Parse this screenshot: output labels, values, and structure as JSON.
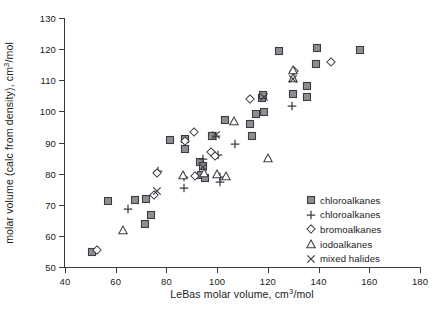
{
  "chart_data": {
    "type": "scatter",
    "title": "",
    "xlabel": "LeBas molar volume, cm3/mol",
    "ylabel": "molar volume (calc from density), cm3/mol",
    "xlabel_parts": {
      "pre": "LeBas molar volume, cm",
      "sup": "3",
      "post": "/mol"
    },
    "ylabel_parts": {
      "pre": "molar volume (calc from density), cm",
      "sup": "3",
      "post": "/mol"
    },
    "xlim": [
      40,
      180
    ],
    "ylim": [
      50,
      130
    ],
    "xticks": [
      40,
      60,
      80,
      100,
      120,
      140,
      160,
      180
    ],
    "yticks": [
      50,
      60,
      70,
      80,
      90,
      100,
      110,
      120,
      130
    ],
    "xtick_labels": [
      "40",
      "60",
      "80",
      "100",
      "120",
      "140",
      "160",
      "180"
    ],
    "ytick_labels": [
      "50",
      "60",
      "70",
      "80",
      "90",
      "100",
      "110",
      "120",
      "130"
    ],
    "grid": false,
    "legend_position": "lower right",
    "series": [
      {
        "name": "chloroalkanes",
        "marker": "square",
        "points": [
          [
            50.6,
            54.8
          ],
          [
            57.0,
            71.2
          ],
          [
            67.6,
            71.4
          ],
          [
            71.4,
            63.8
          ],
          [
            72.0,
            71.7
          ],
          [
            74.0,
            66.7
          ],
          [
            81.3,
            90.8
          ],
          [
            87.2,
            91.0
          ],
          [
            87.2,
            87.9
          ],
          [
            93.3,
            83.7
          ],
          [
            93.8,
            79.6
          ],
          [
            94.6,
            82.3
          ],
          [
            95.2,
            78.7
          ],
          [
            98.0,
            92.1
          ],
          [
            103.0,
            97.3
          ],
          [
            113.0,
            96.1
          ],
          [
            113.6,
            92.2
          ],
          [
            115.3,
            99.2
          ],
          [
            117.8,
            104.2
          ],
          [
            117.9,
            105.3
          ],
          [
            118.5,
            99.8
          ],
          [
            124.2,
            119.3
          ],
          [
            129.8,
            105.6
          ],
          [
            135.3,
            108.3
          ],
          [
            135.4,
            104.7
          ],
          [
            139.0,
            115.2
          ],
          [
            139.4,
            120.3
          ],
          [
            156.5,
            119.8
          ]
        ]
      },
      {
        "name": "chloroalkanes",
        "marker": "plus",
        "points": [
          [
            64.8,
            68.5
          ],
          [
            76.5,
            80.7
          ],
          [
            86.8,
            79.0
          ],
          [
            86.9,
            75.3
          ],
          [
            94.5,
            84.8
          ],
          [
            99.7,
            92.0
          ],
          [
            100.3,
            85.9
          ],
          [
            101.1,
            79.0
          ],
          [
            101.3,
            77.4
          ],
          [
            107.2,
            89.4
          ],
          [
            129.7,
            101.7
          ]
        ]
      },
      {
        "name": "bromoalkanes",
        "marker": "diamond",
        "points": [
          [
            52.8,
            55.5
          ],
          [
            75.2,
            73.1
          ],
          [
            76.2,
            80.2
          ],
          [
            87.4,
            90.6
          ],
          [
            90.7,
            93.4
          ],
          [
            91.3,
            79.3
          ],
          [
            97.6,
            87.1
          ],
          [
            99.0,
            85.8
          ],
          [
            112.8,
            104.0
          ],
          [
            130.2,
            113.0
          ],
          [
            144.9,
            116.0
          ]
        ]
      },
      {
        "name": "iodoalkanes",
        "marker": "triangle",
        "points": [
          [
            62.8,
            61.8
          ],
          [
            86.5,
            79.5
          ],
          [
            94.7,
            80.1
          ],
          [
            100.1,
            79.9
          ],
          [
            103.3,
            79.2
          ],
          [
            106.8,
            96.8
          ],
          [
            120.0,
            85.0
          ],
          [
            129.9,
            113.2
          ],
          [
            130.0,
            110.6
          ]
        ]
      },
      {
        "name": "mixed halides",
        "marker": "x",
        "points": [
          [
            76.3,
            74.3
          ],
          [
            94.6,
            82.2
          ],
          [
            99.6,
            92.3
          ],
          [
            118.4,
            104.5
          ],
          [
            130.1,
            110.5
          ]
        ]
      }
    ]
  },
  "legend": {
    "items": [
      {
        "label": "chloroalkanes",
        "marker": "square"
      },
      {
        "label": "chloroalkanes",
        "marker": "plus"
      },
      {
        "label": "bromoalkanes",
        "marker": "diamond"
      },
      {
        "label": "iodoalkanes",
        "marker": "triangle"
      },
      {
        "label": "mixed halides",
        "marker": "x"
      }
    ]
  },
  "colors": {
    "axis": "#3a3a3a",
    "marker_fill": "#8d8d92",
    "marker_stroke": "#3c3c44",
    "background": "#ffffff",
    "text": "#1a1a1a"
  }
}
